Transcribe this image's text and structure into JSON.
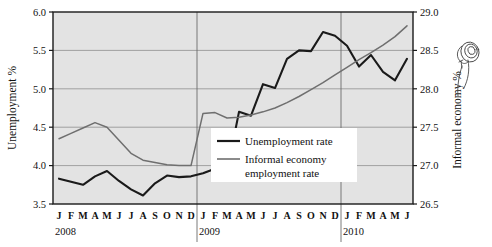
{
  "chart_data": {
    "type": "line",
    "title": "",
    "subtitle": "",
    "xlabel": "",
    "ylabel": "Unemployment %",
    "y2label": "Informal economy %",
    "ylim": [
      3.5,
      6.0
    ],
    "y2lim": [
      26.5,
      29.0
    ],
    "grid": true,
    "legend_position": "center-right-inside",
    "plot_background": "#e3e3e3",
    "line_color_unemployment": "#1a1a1a",
    "line_color_informal": "#6f6f6f",
    "yticks": [
      "3.5",
      "4.0",
      "4.5",
      "5.0",
      "5.5",
      "6.0"
    ],
    "ytick_values": [
      3.5,
      4.0,
      4.5,
      5.0,
      5.5,
      6.0
    ],
    "y2ticks": [
      "26.5",
      "27.0",
      "27.5",
      "28.0",
      "28.5",
      "29.0"
    ],
    "y2tick_values": [
      26.5,
      27.0,
      27.5,
      28.0,
      28.5,
      29.0
    ],
    "x": [
      "J",
      "F",
      "M",
      "A",
      "M",
      "J",
      "J",
      "A",
      "S",
      "O",
      "N",
      "D",
      "J",
      "F",
      "M",
      "A",
      "M",
      "J",
      "J",
      "A",
      "S",
      "O",
      "N",
      "D",
      "J",
      "F",
      "M",
      "A",
      "M",
      "J"
    ],
    "year_groups": [
      {
        "label": "2008",
        "start_index": 0,
        "count": 12
      },
      {
        "label": "2009",
        "start_index": 12,
        "count": 12
      },
      {
        "label": "2010",
        "start_index": 24,
        "count": 6
      }
    ],
    "series": [
      {
        "name": "Unemployment rate",
        "axis": "left",
        "color": "#1a1a1a",
        "values": [
          3.83,
          3.79,
          3.75,
          3.86,
          3.93,
          3.8,
          3.69,
          3.61,
          3.77,
          3.87,
          3.85,
          3.86,
          3.9,
          3.96,
          3.92,
          4.7,
          4.65,
          5.06,
          5.01,
          5.39,
          5.5,
          5.49,
          5.74,
          5.69,
          5.56,
          5.29,
          5.44,
          5.22,
          5.11,
          5.39
        ]
      },
      {
        "name": "Informal economy employment rate",
        "axis": "right",
        "color": "#6f6f6f",
        "values": [
          27.35,
          27.42,
          27.49,
          27.56,
          27.5,
          27.33,
          27.16,
          27.07,
          27.04,
          27.01,
          27.0,
          27.0,
          27.68,
          27.69,
          27.62,
          27.63,
          27.66,
          27.7,
          27.75,
          27.82,
          27.9,
          27.99,
          28.08,
          28.18,
          28.28,
          28.38,
          28.47,
          28.57,
          28.68,
          28.82
        ]
      }
    ],
    "legend": [
      {
        "label": "Unemployment rate",
        "color": "#1a1a1a"
      },
      {
        "label": "Informal economy",
        "color": "#6f6f6f"
      },
      {
        "label": "employment rate",
        "color": "#6f6f6f",
        "continuation": true
      }
    ],
    "annotations": [
      {
        "name": "handwritten-scribble",
        "text": ""
      }
    ]
  }
}
